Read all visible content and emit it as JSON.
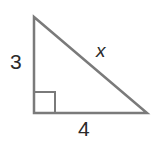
{
  "diagram": {
    "type": "right-triangle",
    "stroke_color": "#7a7a7a",
    "vertices": {
      "top": [
        34,
        17
      ],
      "right_angle": [
        34,
        113
      ],
      "right": [
        147,
        113
      ]
    },
    "right_angle_marker": true,
    "labels": {
      "vertical_leg": "3",
      "horizontal_leg": "4",
      "hypotenuse": "x"
    }
  }
}
